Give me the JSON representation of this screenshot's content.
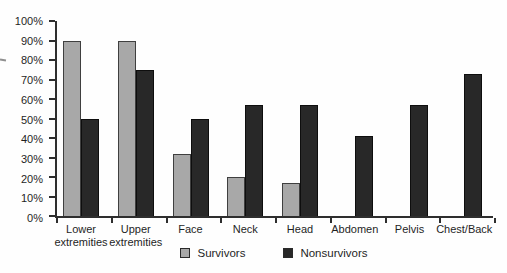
{
  "chart_data": {
    "type": "bar",
    "title": "",
    "categories": [
      "Lower extremities",
      "Upper extremities",
      "Face",
      "Neck",
      "Head",
      "Abdomen",
      "Pelvis",
      "Chest/Back"
    ],
    "x_tick_labels": [
      "Lower\nextremities",
      "Upper\nextremities",
      "Face",
      "Neck",
      "Head",
      "Abdomen",
      "Pelvis",
      "Chest/Back"
    ],
    "series": [
      {
        "name": "Survivors",
        "values": [
          90,
          90,
          32,
          20,
          17,
          0,
          0,
          0
        ],
        "fill": "#a8a8a8",
        "border": "#3f3f3f"
      },
      {
        "name": "Nonsurvivors",
        "values": [
          50,
          75,
          50,
          57,
          57,
          41,
          57,
          73
        ],
        "fill": "#282828",
        "border": "#0e0e0e"
      }
    ],
    "y_ticks": [
      "0%",
      "10%",
      "20%",
      "30%",
      "40%",
      "50%",
      "60%",
      "70%",
      "80%",
      "90%",
      "100%"
    ],
    "ylim": [
      0,
      100
    ],
    "xlabel": "",
    "ylabel": "",
    "grid": false,
    "legend_position": "bottom",
    "axis_color": "#2e2e2e",
    "background": "#fefefe"
  }
}
